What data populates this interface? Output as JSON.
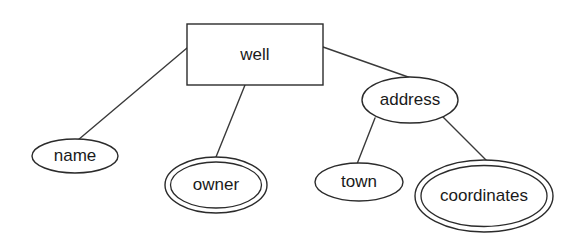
{
  "diagram": {
    "type": "er-diagram",
    "background_color": "#ffffff",
    "stroke_color": "#2b2b2b",
    "text_color": "#1a1a1a",
    "entities": [
      {
        "id": "well",
        "label": "well",
        "shape": "rectangle",
        "role": "entity",
        "x": 187,
        "y": 24,
        "width": 136,
        "height": 61,
        "center_x": 255,
        "center_y": 55
      }
    ],
    "attributes": [
      {
        "id": "name",
        "label": "name",
        "shape": "ellipse",
        "role": "attribute",
        "center_x": 75,
        "center_y": 156,
        "rx": 43,
        "ry": 17
      },
      {
        "id": "owner",
        "label": "owner",
        "shape": "double-ellipse",
        "role": "multivalued-attribute",
        "center_x": 216,
        "center_y": 185,
        "rx": 51,
        "ry": 28
      },
      {
        "id": "address",
        "label": "address",
        "shape": "ellipse",
        "role": "composite-attribute",
        "center_x": 410,
        "center_y": 100,
        "rx": 48,
        "ry": 23
      },
      {
        "id": "town",
        "label": "town",
        "shape": "ellipse",
        "role": "attribute",
        "center_x": 359,
        "center_y": 182,
        "rx": 44,
        "ry": 19
      },
      {
        "id": "coordinates",
        "label": "coordinates",
        "shape": "double-ellipse",
        "role": "multivalued-attribute",
        "center_x": 484,
        "center_y": 196,
        "rx": 69,
        "ry": 36
      }
    ],
    "edges": [
      {
        "id": "well-name",
        "from": "well",
        "to": "name",
        "x1": 187,
        "y1": 48,
        "x2": 78,
        "y2": 140
      },
      {
        "id": "well-owner",
        "from": "well",
        "to": "owner",
        "x1": 245,
        "y1": 85,
        "x2": 216,
        "y2": 157
      },
      {
        "id": "well-address",
        "from": "well",
        "to": "address",
        "x1": 323,
        "y1": 47,
        "x2": 411,
        "y2": 78
      },
      {
        "id": "address-town",
        "from": "address",
        "to": "town",
        "x1": 375,
        "y1": 118,
        "x2": 357,
        "y2": 164
      },
      {
        "id": "address-coordinates",
        "from": "address",
        "to": "coordinates",
        "x1": 443,
        "y1": 117,
        "x2": 487,
        "y2": 161
      }
    ]
  }
}
